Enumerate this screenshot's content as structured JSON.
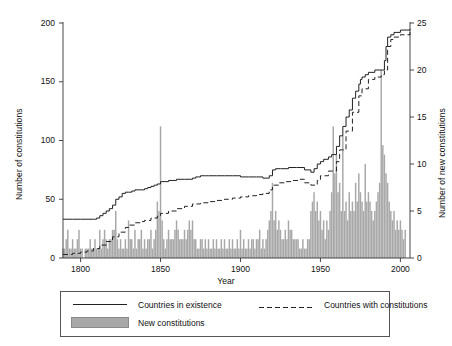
{
  "chart_data": {
    "type": "line",
    "title": "",
    "xlabel": "Year",
    "ylabel": "Number of constitutions",
    "ylabel_right": "Number of new constitutions",
    "xlim": [
      1789,
      2006
    ],
    "ylim": [
      0,
      200
    ],
    "ylim_right": [
      0,
      25
    ],
    "grid": false,
    "legend_position": "bottom",
    "xticks": [
      "1800",
      "1850",
      "1900",
      "1950",
      "2000"
    ],
    "xtick_values": [
      1800,
      1850,
      1900,
      1950,
      2000
    ],
    "yticks_left": [
      "0",
      "50",
      "100",
      "150",
      "200"
    ],
    "ytick_values_left": [
      0,
      50,
      100,
      150,
      200
    ],
    "yticks_right": [
      "0",
      "5",
      "10",
      "15",
      "20",
      "25"
    ],
    "ytick_values_right": [
      0,
      5,
      10,
      15,
      20,
      25
    ],
    "legend": [
      {
        "label": "Countries in existence",
        "style": "solid-line",
        "color": "#222222"
      },
      {
        "label": "Countries with constitutions",
        "style": "dashed-line",
        "color": "#222222"
      },
      {
        "label": "New constitutions",
        "style": "filled-bar",
        "color": "#a8a8a8"
      }
    ],
    "series": [
      {
        "name": "Countries in existence",
        "axis": "left",
        "style": "solid",
        "x": [
          1789,
          1795,
          1800,
          1804,
          1808,
          1810,
          1812,
          1814,
          1816,
          1818,
          1820,
          1822,
          1824,
          1826,
          1828,
          1830,
          1832,
          1834,
          1836,
          1838,
          1840,
          1842,
          1844,
          1846,
          1848,
          1850,
          1855,
          1860,
          1865,
          1870,
          1872,
          1875,
          1878,
          1880,
          1885,
          1890,
          1895,
          1900,
          1905,
          1910,
          1914,
          1918,
          1920,
          1922,
          1925,
          1930,
          1935,
          1940,
          1944,
          1946,
          1948,
          1950,
          1952,
          1955,
          1957,
          1960,
          1962,
          1964,
          1966,
          1968,
          1970,
          1972,
          1974,
          1975,
          1976,
          1978,
          1980,
          1984,
          1988,
          1990,
          1991,
          1992,
          1994,
          1996,
          2000,
          2006
        ],
        "values": [
          33,
          33,
          33,
          33,
          33,
          34,
          36,
          38,
          40,
          42,
          45,
          50,
          52,
          55,
          56,
          56,
          57,
          58,
          58,
          58,
          59,
          60,
          61,
          62,
          63,
          65,
          66,
          67,
          67,
          68,
          69,
          70,
          70,
          70,
          70,
          70,
          70,
          69,
          69,
          69,
          68,
          70,
          75,
          76,
          76,
          77,
          77,
          75,
          73,
          76,
          80,
          82,
          84,
          86,
          88,
          95,
          104,
          112,
          120,
          126,
          136,
          142,
          148,
          152,
          154,
          156,
          158,
          160,
          160,
          168,
          180,
          188,
          190,
          192,
          194,
          195
        ]
      },
      {
        "name": "Countries with constitutions",
        "axis": "left",
        "style": "dashed",
        "x": [
          1789,
          1795,
          1800,
          1804,
          1808,
          1812,
          1816,
          1820,
          1824,
          1828,
          1830,
          1834,
          1838,
          1840,
          1844,
          1848,
          1850,
          1855,
          1860,
          1865,
          1870,
          1875,
          1880,
          1885,
          1890,
          1895,
          1900,
          1905,
          1910,
          1914,
          1918,
          1920,
          1924,
          1928,
          1932,
          1936,
          1940,
          1944,
          1948,
          1950,
          1955,
          1960,
          1962,
          1966,
          1970,
          1974,
          1976,
          1980,
          1984,
          1988,
          1990,
          1992,
          1994,
          1996,
          2000,
          2006
        ],
        "values": [
          3,
          4,
          5,
          6,
          8,
          11,
          14,
          18,
          22,
          26,
          28,
          30,
          31,
          32,
          34,
          36,
          38,
          40,
          42,
          44,
          46,
          47,
          48,
          49,
          50,
          51,
          52,
          53,
          54,
          55,
          58,
          62,
          64,
          65,
          66,
          67,
          64,
          62,
          66,
          70,
          74,
          82,
          92,
          108,
          124,
          138,
          144,
          152,
          154,
          156,
          160,
          180,
          186,
          188,
          190,
          194
        ]
      }
    ],
    "bars": {
      "name": "New constitutions",
      "axis": "right",
      "color": "#a8a8a8",
      "x": [
        1789,
        1790,
        1791,
        1792,
        1793,
        1794,
        1795,
        1796,
        1797,
        1798,
        1799,
        1800,
        1801,
        1802,
        1803,
        1804,
        1805,
        1806,
        1807,
        1808,
        1809,
        1810,
        1811,
        1812,
        1813,
        1814,
        1815,
        1816,
        1817,
        1818,
        1819,
        1820,
        1821,
        1822,
        1823,
        1824,
        1825,
        1826,
        1827,
        1828,
        1829,
        1830,
        1831,
        1832,
        1833,
        1834,
        1835,
        1836,
        1837,
        1838,
        1839,
        1840,
        1841,
        1842,
        1843,
        1844,
        1845,
        1846,
        1847,
        1848,
        1849,
        1850,
        1851,
        1852,
        1853,
        1854,
        1855,
        1856,
        1857,
        1858,
        1859,
        1860,
        1861,
        1862,
        1863,
        1864,
        1865,
        1866,
        1867,
        1868,
        1869,
        1870,
        1871,
        1872,
        1873,
        1874,
        1875,
        1876,
        1877,
        1878,
        1879,
        1880,
        1881,
        1882,
        1883,
        1884,
        1885,
        1886,
        1887,
        1888,
        1889,
        1890,
        1891,
        1892,
        1893,
        1894,
        1895,
        1896,
        1897,
        1898,
        1899,
        1900,
        1901,
        1902,
        1903,
        1904,
        1905,
        1906,
        1907,
        1908,
        1909,
        1910,
        1911,
        1912,
        1913,
        1914,
        1915,
        1916,
        1917,
        1918,
        1919,
        1920,
        1921,
        1922,
        1923,
        1924,
        1925,
        1926,
        1927,
        1928,
        1929,
        1930,
        1931,
        1932,
        1933,
        1934,
        1935,
        1936,
        1937,
        1938,
        1939,
        1940,
        1941,
        1942,
        1943,
        1944,
        1945,
        1946,
        1947,
        1948,
        1949,
        1950,
        1951,
        1952,
        1953,
        1954,
        1955,
        1956,
        1957,
        1958,
        1959,
        1960,
        1961,
        1962,
        1963,
        1964,
        1965,
        1966,
        1967,
        1968,
        1969,
        1970,
        1971,
        1972,
        1973,
        1974,
        1975,
        1976,
        1977,
        1978,
        1979,
        1980,
        1981,
        1982,
        1983,
        1984,
        1985,
        1986,
        1987,
        1988,
        1989,
        1990,
        1991,
        1992,
        1993,
        1994,
        1995,
        1996,
        1997,
        1998,
        1999,
        2000,
        2001,
        2002,
        2003,
        2004,
        2005
      ],
      "values": [
        1,
        1,
        2,
        3,
        1,
        1,
        2,
        1,
        1,
        2,
        3,
        1,
        1,
        0,
        1,
        1,
        1,
        2,
        1,
        1,
        2,
        1,
        1,
        3,
        1,
        2,
        3,
        2,
        1,
        2,
        2,
        3,
        3,
        5,
        2,
        1,
        2,
        1,
        1,
        2,
        1,
        4,
        2,
        2,
        1,
        3,
        1,
        2,
        2,
        3,
        1,
        2,
        1,
        2,
        2,
        3,
        1,
        2,
        3,
        6,
        5,
        14,
        4,
        2,
        1,
        2,
        3,
        2,
        2,
        2,
        3,
        4,
        3,
        2,
        2,
        2,
        3,
        2,
        3,
        4,
        3,
        4,
        2,
        2,
        1,
        1,
        2,
        2,
        1,
        2,
        1,
        2,
        1,
        1,
        2,
        1,
        2,
        1,
        1,
        2,
        1,
        2,
        1,
        1,
        2,
        1,
        2,
        1,
        1,
        2,
        1,
        3,
        1,
        2,
        1,
        1,
        2,
        1,
        2,
        2,
        1,
        2,
        2,
        3,
        1,
        2,
        1,
        2,
        3,
        4,
        5,
        8,
        4,
        5,
        3,
        4,
        3,
        2,
        2,
        3,
        2,
        4,
        3,
        3,
        2,
        2,
        2,
        2,
        1,
        1,
        2,
        1,
        1,
        2,
        2,
        5,
        6,
        7,
        5,
        6,
        4,
        5,
        3,
        4,
        2,
        4,
        3,
        5,
        7,
        14,
        9,
        11,
        7,
        8,
        5,
        13,
        5,
        6,
        4,
        7,
        5,
        6,
        5,
        8,
        6,
        9,
        7,
        6,
        5,
        10,
        6,
        7,
        6,
        5,
        4,
        5,
        6,
        7,
        8,
        20,
        12,
        11,
        9,
        8,
        6,
        5,
        4,
        5,
        3,
        4,
        3,
        4,
        3,
        2,
        3
      ]
    }
  }
}
